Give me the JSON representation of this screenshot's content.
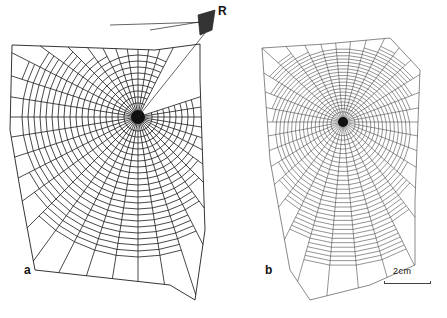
{
  "figure": {
    "panels": [
      {
        "label": "a",
        "hub": [
          138,
          117
        ],
        "radii": 40,
        "spirals": 22,
        "max_r": 140,
        "stroke": "#1a1a1a",
        "width": 0.8,
        "missing_sector_deg": [
          300,
          335
        ]
      },
      {
        "label": "b",
        "hub": [
          343,
          122
        ],
        "radii": 34,
        "spirals": 30,
        "max_r": 125,
        "stroke": "#3a3a3a",
        "width": 0.55,
        "missing_sector_deg": []
      }
    ],
    "retreat_label": "R",
    "scale_bar": {
      "text": "2cm"
    }
  }
}
